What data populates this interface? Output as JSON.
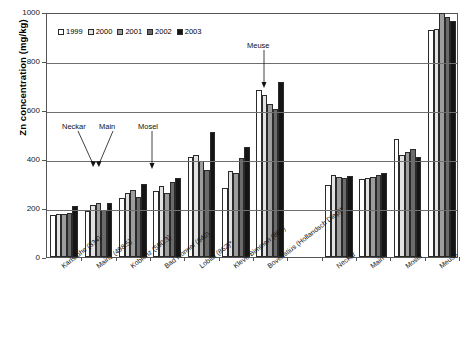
{
  "chart_data": {
    "type": "bar",
    "title": "",
    "xlabel": "",
    "ylabel": "Zn concentration (mg/kg)",
    "ylim": [
      0,
      1000
    ],
    "yticks": [
      0,
      200,
      400,
      600,
      800,
      1000
    ],
    "grid": true,
    "legend_position": "top-left",
    "categories": [
      "Karlsruhe (334)",
      "Mainz (498.5)",
      "Koblenz (590.3)",
      "Bad Honnef (640)",
      "Lobith (862)*",
      "Kleve-Bimmen (865)",
      "Bovenstius (Hollandsch Diep)*",
      "",
      "Neckar",
      "Main",
      "Mosel",
      "Meuse"
    ],
    "series": [
      {
        "name": "1999",
        "color": "#ffffff",
        "values": [
          172,
          186,
          241,
          268,
          408,
          282,
          681,
          null,
          292,
          320,
          481,
          927
        ]
      },
      {
        "name": "2000",
        "color": "#e2e2e2",
        "values": [
          174,
          212,
          261,
          290,
          415,
          352,
          662,
          null,
          336,
          323,
          418,
          931
        ]
      },
      {
        "name": "2001",
        "color": "#9d9d9d",
        "values": [
          176,
          219,
          272,
          263,
          392,
          343,
          626,
          null,
          325,
          328,
          427,
          994
        ]
      },
      {
        "name": "2002",
        "color": "#6b6b6b",
        "values": [
          180,
          192,
          247,
          306,
          356,
          404,
          606,
          null,
          323,
          334,
          440,
          978
        ]
      },
      {
        "name": "2003",
        "color": "#151515",
        "values": [
          208,
          222,
          300,
          321,
          511,
          450,
          713,
          null,
          330,
          341,
          407,
          963
        ]
      }
    ],
    "annotations": [
      {
        "label": "Neckar",
        "target_category": "Karlsruhe (334)"
      },
      {
        "label": "Main",
        "target_category": "Mainz (498.5)"
      },
      {
        "label": "Mosel",
        "target_category": "Koblenz (590.3)"
      },
      {
        "label": "Meuse",
        "target_category": "Bovenstius (Hollandsch Diep)*"
      }
    ]
  }
}
